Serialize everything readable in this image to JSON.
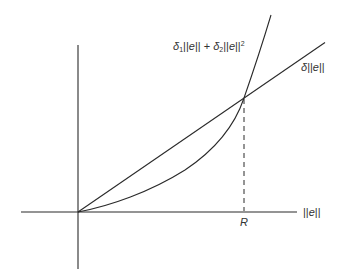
{
  "diagram": {
    "type": "function-comparison-plot",
    "stroke_color": "#2a2a2a",
    "text_color": "#333333",
    "background": "#ffffff",
    "axes": {
      "x_label": {
        "bar_left": "||",
        "var": "e",
        "bar_right": "||"
      },
      "y_label": ""
    },
    "curves": {
      "quadratic": {
        "label": {
          "d1": "δ",
          "d1_sub": "1",
          "bars1a": "||",
          "e1": "e",
          "bars1b": "||",
          "plus": " + ",
          "d2": "δ",
          "d2_sub": "2",
          "bars2a": "||",
          "e2": "e",
          "bars2b": "||",
          "sup": "2"
        },
        "expression": "δ1||e|| + δ2||e||^2"
      },
      "linear": {
        "label": {
          "d": "δ",
          "bars_a": "||",
          "e": "e",
          "bars_b": "||"
        },
        "expression": "δ||e||"
      }
    },
    "intersection": {
      "marker_label": "R",
      "dashed_drop_line": true
    }
  }
}
